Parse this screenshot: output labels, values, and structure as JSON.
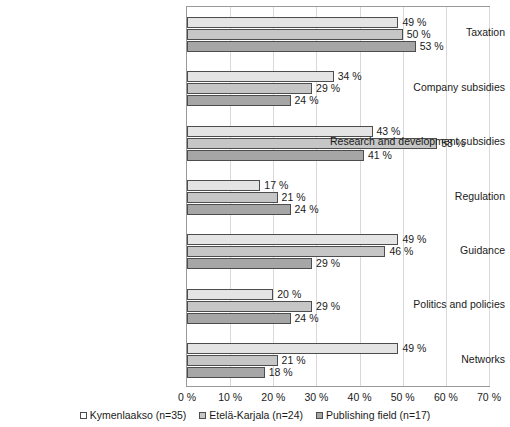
{
  "chart_data": {
    "type": "bar",
    "orientation": "horizontal",
    "title": "",
    "subtitle": "",
    "xlabel": "",
    "ylabel": "",
    "xlim": [
      0,
      70
    ],
    "xticks": [
      0,
      10,
      20,
      30,
      40,
      50,
      60,
      70
    ],
    "xtick_labels": [
      "0 %",
      "10 %",
      "20 %",
      "30 %",
      "40 %",
      "50 %",
      "60 %",
      "70 %"
    ],
    "grid": true,
    "grid_axis": "x",
    "legend_position": "bottom",
    "value_labels": true,
    "value_label_suffix": " %",
    "categories": [
      "Taxation",
      "Company subsidies",
      "Research and development subsidies",
      "Regulation",
      "Guidance",
      "Politics and policies",
      "Networks"
    ],
    "series": [
      {
        "name": "Kymenlaakso (n=35)",
        "color": "#e4e4e4",
        "values": [
          49,
          34,
          43,
          17,
          49,
          20,
          49
        ],
        "labels": [
          "49 %",
          "34 %",
          "43 %",
          "17 %",
          "49 %",
          "20 %",
          "49 %"
        ]
      },
      {
        "name": "Etelä-Karjala (n=24)",
        "color": "#c6c6c6",
        "values": [
          50,
          29,
          58,
          21,
          46,
          29,
          21
        ],
        "labels": [
          "50 %",
          "29 %",
          "58 %",
          "21 %",
          "46 %",
          "29 %",
          "21 %"
        ]
      },
      {
        "name": "Publishing field (n=17)",
        "color": "#a6a6a6",
        "values": [
          53,
          24,
          41,
          24,
          29,
          24,
          18
        ],
        "labels": [
          "53 %",
          "24 %",
          "41 %",
          "24 %",
          "29 %",
          "24 %",
          "18 %"
        ]
      }
    ]
  },
  "colors": {
    "series_1": "#e4e4e4",
    "series_2": "#c6c6c6",
    "series_3": "#a6a6a6",
    "bar_border": "#4d4d4d",
    "gridline": "#d8d8d8",
    "frame": "#9a9a9a",
    "text": "#1a1a1a",
    "background": "#ffffff"
  }
}
